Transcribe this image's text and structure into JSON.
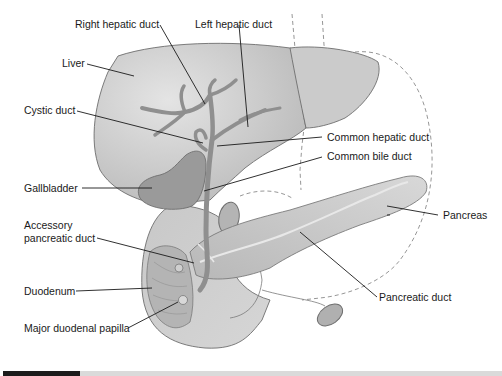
{
  "figure": {
    "colors": {
      "organ_fill": "#c4c4c4",
      "organ_light": "#d6d6d6",
      "organ_stroke": "#6e6e6e",
      "duct_fill": "#8f8f8f",
      "gallbladder_fill": "#9a9a9a",
      "leader_line": "#1a1a1a",
      "dashed_outline": "#8a8a8a"
    },
    "labels": {
      "right_hepatic_duct": "Right hepatic duct",
      "left_hepatic_duct": "Left hepatic duct",
      "liver": "Liver",
      "cystic_duct": "Cystic duct",
      "common_hepatic_duct": "Common hepatic duct",
      "common_bile_duct": "Common bile duct",
      "gallbladder": "Gallbladder",
      "pancreas": "Pancreas",
      "accessory_pancreatic_duct_line1": "Accessory",
      "accessory_pancreatic_duct_line2": "pancreatic duct",
      "duodenum": "Duodenum",
      "pancreatic_duct": "Pancreatic duct",
      "major_duodenal_papilla": "Major duodenal papilla"
    }
  }
}
